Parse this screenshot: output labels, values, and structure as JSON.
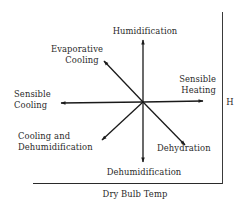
{
  "diagram": {
    "title": "",
    "axes": {
      "x_label": "Dry Bulb Temp",
      "y_label": "H"
    },
    "center": [
      143,
      102
    ],
    "processes": [
      {
        "id": "humidification",
        "label_lines": [
          "Humidification"
        ],
        "tip": [
          143,
          40
        ]
      },
      {
        "id": "evaporative-cooling",
        "label_lines": [
          "Evaporative",
          "Cooling"
        ],
        "tip": [
          104,
          61
        ]
      },
      {
        "id": "sensible-heating",
        "label_lines": [
          "Sensible",
          "Heating"
        ],
        "tip": [
          203,
          101
        ]
      },
      {
        "id": "sensible-cooling",
        "label_lines": [
          "Sensible",
          "Cooling"
        ],
        "tip": [
          61,
          103
        ]
      },
      {
        "id": "cooling-and-dehumidification",
        "label_lines": [
          "Cooling and",
          "Dehumidification"
        ],
        "tip": [
          102,
          140
        ]
      },
      {
        "id": "dehydration",
        "label_lines": [
          "Dehydration"
        ],
        "tip": [
          185,
          145
        ]
      },
      {
        "id": "dehumidification",
        "label_lines": [
          "Dehumidification"
        ],
        "tip": [
          143,
          162
        ]
      }
    ],
    "colors": {
      "line": "#1a1a1a",
      "text": "#2a2a2a",
      "background": "#ffffff"
    }
  }
}
